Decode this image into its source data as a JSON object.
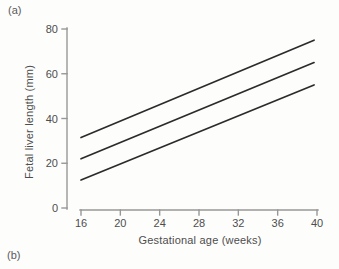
{
  "page": {
    "panel_label_a": "(a)",
    "panel_label_b": "(b)"
  },
  "colors": {
    "background": "#fdfdfc",
    "axis": "#979797",
    "data_line": "#2b2b2b",
    "text": "#4d4d4d"
  },
  "chart_data": {
    "type": "line",
    "title": "",
    "xlabel": "Gestational age (weeks)",
    "ylabel": "Fetal liver length (mm)",
    "xlim": [
      16,
      40
    ],
    "ylim": [
      0,
      80
    ],
    "xticks": [
      16,
      20,
      24,
      28,
      32,
      36,
      40
    ],
    "yticks": [
      0,
      20,
      40,
      60,
      80
    ],
    "grid": false,
    "legend": null,
    "series": [
      {
        "name": "upper-line",
        "x": [
          16,
          39.7
        ],
        "y": [
          31.5,
          75
        ]
      },
      {
        "name": "middle-line",
        "x": [
          16,
          39.7
        ],
        "y": [
          22,
          65
        ]
      },
      {
        "name": "lower-line",
        "x": [
          16,
          39.7
        ],
        "y": [
          12.5,
          55
        ]
      }
    ]
  }
}
